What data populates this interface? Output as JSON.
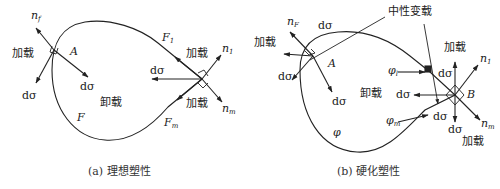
{
  "diagram_a": {
    "caption": "(a) 理想塑性",
    "labels": {
      "n_f": "n",
      "n_f_sub": "f",
      "loading_left": "加载",
      "A": "A",
      "dsigma_inner": "dσ",
      "dsigma_left": "dσ",
      "unloading": "卸载",
      "F": "F",
      "F1": "F",
      "F1_sub": "1",
      "loading_upper_right": "加载",
      "n1": "n",
      "n1_sub": "1",
      "dsigma_right": "dσ",
      "loading_lower_right": "加载",
      "nm": "n",
      "nm_sub": "m",
      "Fm": "F",
      "Fm_sub": "m"
    }
  },
  "diagram_b": {
    "caption": "(b) 硬化塑性",
    "labels": {
      "neutral_loading": "中性变载",
      "n_F": "n",
      "n_F_sub": "F",
      "dsigma_top": "dσ",
      "loading_left": "加载",
      "A": "A",
      "dsigma_left": "dσ",
      "dsigma_inner": "dσ",
      "unloading": "卸载",
      "phi": "φ",
      "phi_l": "φ",
      "phi_l_sub": "l",
      "dsigma_right_upper": "dσ",
      "loading_upper_right": "加载",
      "n1": "n",
      "n1_sub": "1",
      "dsigma_mid": "dσ",
      "B": "B",
      "phi_m": "φ",
      "phi_m_sub": "m",
      "dsigma_lower": "dσ",
      "dsigma_bottom": "dσ",
      "nm": "n",
      "nm_sub": "m",
      "loading_lower_right": "加载"
    }
  }
}
